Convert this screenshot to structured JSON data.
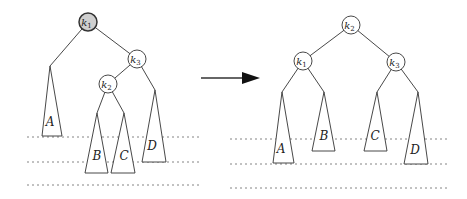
{
  "diagram": {
    "colors": {
      "stroke": "#333333",
      "root_fill": "#cfcfcf",
      "node_fill": "#ffffff",
      "dash": "#666666"
    },
    "before": {
      "nodes": [
        {
          "id": "k1",
          "base": "k",
          "sub": "1",
          "cx": 88,
          "cy": 22,
          "highlighted": true
        },
        {
          "id": "k3",
          "base": "k",
          "sub": "3",
          "cx": 137,
          "cy": 59,
          "highlighted": false
        },
        {
          "id": "k2",
          "base": "k",
          "sub": "2",
          "cx": 108,
          "cy": 84,
          "highlighted": false
        }
      ],
      "subtrees": [
        {
          "label": "A",
          "apex": [
            50,
            66
          ],
          "base_l": [
            42,
            136
          ],
          "base_r": [
            62,
            136
          ],
          "text_pos": [
            50,
            126
          ]
        },
        {
          "label": "B",
          "apex": [
            97,
            113
          ],
          "base_l": [
            85,
            173
          ],
          "base_r": [
            108,
            173
          ],
          "text_pos": [
            97,
            160
          ]
        },
        {
          "label": "C",
          "apex": [
            124,
            113
          ],
          "base_l": [
            111,
            173
          ],
          "base_r": [
            135,
            173
          ],
          "text_pos": [
            124,
            160
          ]
        },
        {
          "label": "D",
          "apex": [
            155,
            90
          ],
          "base_l": [
            142,
            162
          ],
          "base_r": [
            166,
            162
          ],
          "text_pos": [
            152,
            150
          ]
        }
      ]
    },
    "after": {
      "nodes": [
        {
          "id": "k2",
          "base": "k",
          "sub": "2",
          "cx": 351,
          "cy": 25,
          "highlighted": false
        },
        {
          "id": "k1",
          "base": "k",
          "sub": "1",
          "cx": 303,
          "cy": 61,
          "highlighted": false
        },
        {
          "id": "k3",
          "base": "k",
          "sub": "3",
          "cx": 396,
          "cy": 62,
          "highlighted": false
        }
      ],
      "subtrees": [
        {
          "label": "A",
          "apex": [
            282,
            92
          ],
          "base_l": [
            273,
            163
          ],
          "base_r": [
            294,
            163
          ],
          "text_pos": [
            281,
            153
          ]
        },
        {
          "label": "B",
          "apex": [
            324,
            92
          ],
          "base_l": [
            312,
            151
          ],
          "base_r": [
            335,
            151
          ],
          "text_pos": [
            324,
            140
          ]
        },
        {
          "label": "C",
          "apex": [
            377,
            92
          ],
          "base_l": [
            364,
            151
          ],
          "base_r": [
            387,
            151
          ],
          "text_pos": [
            375,
            140
          ]
        },
        {
          "label": "D",
          "apex": [
            418,
            92
          ],
          "base_l": [
            404,
            164
          ],
          "base_r": [
            428,
            164
          ],
          "text_pos": [
            415,
            154
          ]
        }
      ]
    },
    "arrow": {
      "x1": 201,
      "y1": 78,
      "x2": 260,
      "y2": 78
    },
    "dashed_levels": [
      {
        "x1": 27,
        "x2": 200,
        "y": 137
      },
      {
        "x1": 27,
        "x2": 200,
        "y": 162
      },
      {
        "x1": 27,
        "x2": 200,
        "y": 185
      },
      {
        "x1": 230,
        "x2": 447,
        "y": 139
      },
      {
        "x1": 230,
        "x2": 447,
        "y": 164
      },
      {
        "x1": 230,
        "x2": 447,
        "y": 188
      }
    ]
  }
}
